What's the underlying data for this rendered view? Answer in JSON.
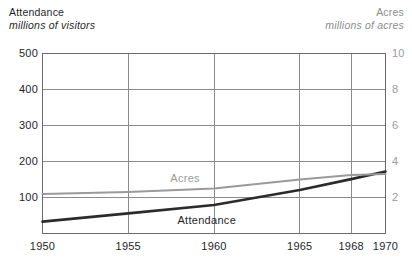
{
  "chart_data": {
    "type": "line",
    "title": "",
    "xlabel": "",
    "grid": true,
    "legend_position": "inline",
    "x": [
      1950,
      1955,
      1960,
      1965,
      1968,
      1970
    ],
    "xlim": [
      1950,
      1970
    ],
    "left_axis": {
      "name": "Attendance",
      "units": "millions of visitors",
      "ticks": [
        100,
        200,
        300,
        400,
        500
      ],
      "ylim": [
        0,
        500
      ],
      "color": "#2b2b2b"
    },
    "right_axis": {
      "name": "Acres",
      "units": "millions of acres",
      "ticks": [
        2,
        4,
        6,
        8,
        10
      ],
      "ylim": [
        0,
        10
      ],
      "color": "#9a9a9a"
    },
    "series": [
      {
        "name": "Attendance",
        "axis": "left",
        "unit": "millions of visitors",
        "color": "#2b2b2b",
        "points": [
          {
            "x": 1950,
            "y": 33
          },
          {
            "x": 1955,
            "y": 56
          },
          {
            "x": 1960,
            "y": 79
          },
          {
            "x": 1965,
            "y": 121
          },
          {
            "x": 1968,
            "y": 151
          },
          {
            "x": 1970,
            "y": 172
          }
        ]
      },
      {
        "name": "Acres",
        "axis": "right",
        "unit": "millions of acres",
        "color": "#9a9a9a",
        "points": [
          {
            "x": 1950,
            "y": 2.2
          },
          {
            "x": 1955,
            "y": 2.3
          },
          {
            "x": 1960,
            "y": 2.5
          },
          {
            "x": 1965,
            "y": 3.0
          },
          {
            "x": 1968,
            "y": 3.25
          },
          {
            "x": 1970,
            "y": 3.3
          }
        ]
      }
    ],
    "annotations": [
      {
        "text": "Acres",
        "x": 1958.5,
        "y_px": 178,
        "color": "#9a9a9a"
      },
      {
        "text": "Attendance",
        "x": 1959.5,
        "y_px": 220,
        "color": "#1f1f1f"
      }
    ]
  },
  "header": {
    "left": {
      "name": "Attendance",
      "units": "millions of visitors"
    },
    "right": {
      "name": "Acres",
      "units": "millions of acres"
    }
  },
  "axes": {
    "left_ticks": [
      "500",
      "400",
      "300",
      "200",
      "100"
    ],
    "right_ticks": [
      "10",
      "8",
      "6",
      "4",
      "2"
    ],
    "x_ticks": [
      "1950",
      "1955",
      "1960",
      "1965",
      "1968",
      "1970"
    ]
  },
  "labels": {
    "acres": "Acres",
    "attendance": "Attendance"
  },
  "colors": {
    "attendance_line": "#2b2b2b",
    "acres_line": "#9a9a9a",
    "grid": "#8c8c8c",
    "frame": "#6b6b6b",
    "background": "#ffffff"
  }
}
